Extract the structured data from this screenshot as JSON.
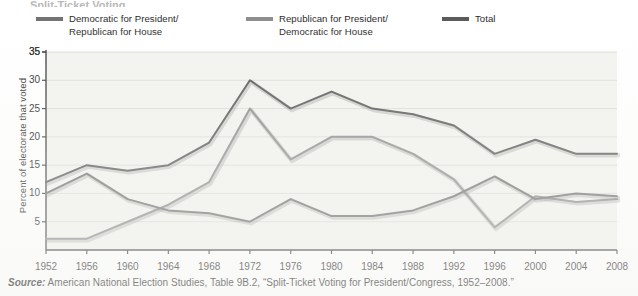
{
  "figure": {
    "title_sliver": "Split-Ticket Voting",
    "plot_bg": "#f2f2ef",
    "axis_color": "#3a3a3a",
    "grid_color": "#dcdcd8"
  },
  "legend": {
    "position": "top",
    "items": [
      {
        "label": "Democratic for President/\nRepublican for House",
        "color": "#6e6e6e",
        "key": "dem-pres-rep-house"
      },
      {
        "label": "Republican for President/\nDemocratic for House",
        "color": "#8a8a8a",
        "key": "rep-pres-dem-house"
      },
      {
        "label": "Total",
        "color": "#555555",
        "key": "total"
      }
    ]
  },
  "axes": {
    "ylabel": "Percent of electorate that voted",
    "yticks": [
      35,
      30,
      25,
      20,
      15,
      10,
      5
    ],
    "xticks": [
      "1952",
      "1956",
      "1960",
      "1964",
      "1968",
      "1972",
      "1976",
      "1980",
      "1984",
      "1988",
      "1992",
      "1996",
      "2000",
      "2004",
      "2008"
    ]
  },
  "source": {
    "prefix": "Source:",
    "text": " American National Election Studies, Table 9B.2, “Split-Ticket Voting for President/Congress, 1952–2008.”"
  },
  "chart_data": {
    "type": "line",
    "title": "Split-Ticket Voting",
    "xlabel": "",
    "ylabel": "Percent of electorate that voted",
    "x": [
      1952,
      1956,
      1960,
      1964,
      1968,
      1972,
      1976,
      1980,
      1984,
      1988,
      1992,
      1996,
      2000,
      2004,
      2008
    ],
    "xlim": [
      1952,
      2008
    ],
    "ylim": [
      0,
      35
    ],
    "grid": true,
    "legend_position": "top",
    "series": [
      {
        "name": "Democratic for President/Republican for House",
        "color": "#6e6e6e",
        "values": [
          10,
          13.5,
          9,
          7,
          6.5,
          5,
          9,
          6,
          6,
          7,
          9.5,
          13,
          9,
          10,
          9.5
        ]
      },
      {
        "name": "Republican for President/Democratic for House",
        "color": "#8a8a8a",
        "values": [
          2,
          2,
          5,
          8,
          12,
          25,
          16,
          20,
          20,
          17,
          12.5,
          4,
          9.5,
          8.5,
          9
        ]
      },
      {
        "name": "Total",
        "color": "#555555",
        "values": [
          12,
          15,
          14,
          15,
          19,
          30,
          25,
          28,
          25,
          24,
          22,
          17,
          19.5,
          17,
          17
        ]
      }
    ]
  }
}
